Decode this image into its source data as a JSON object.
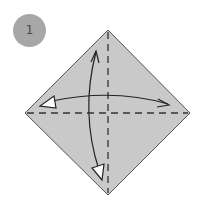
{
  "step": {
    "number": "1"
  },
  "paper": {
    "fill": "#c9c9c9",
    "edge": "#555555",
    "vertices": {
      "top": [
        108,
        30
      ],
      "right": [
        190,
        113
      ],
      "bottom": [
        108,
        195
      ],
      "left": [
        25,
        113
      ]
    }
  },
  "creases": [
    {
      "type": "valley-fold",
      "orientation": "vertical",
      "style": "dashed"
    },
    {
      "type": "valley-fold",
      "orientation": "horizontal",
      "style": "dashed"
    }
  ],
  "arrows": [
    {
      "name": "fold-and-unfold-vertical",
      "from": "top",
      "to": "bottom"
    },
    {
      "name": "fold-and-unfold-horizontal",
      "from": "right",
      "to": "left"
    }
  ],
  "colors": {
    "badge": "#a7a7a7",
    "badge_text": "#4a4a4a",
    "line": "#333333"
  }
}
